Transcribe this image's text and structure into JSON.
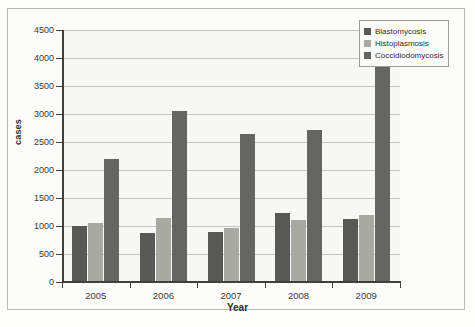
{
  "chart_data": {
    "type": "bar",
    "title": "",
    "xlabel": "Year",
    "ylabel": "cases",
    "categories": [
      "2005",
      "2006",
      "2007",
      "2008",
      "2009"
    ],
    "series": [
      {
        "name": "Blastomycosis",
        "color": "#585856",
        "values": [
          1000,
          870,
          900,
          1240,
          1130
        ]
      },
      {
        "name": "Histoplasmosis",
        "color": "#a9a9a4",
        "values": [
          1050,
          1150,
          970,
          1110,
          1200
        ]
      },
      {
        "name": "Coccidiodomycosis",
        "color": "#656563",
        "values": [
          2200,
          3060,
          2640,
          2710,
          4200
        ]
      }
    ],
    "ylim": [
      0,
      4500
    ],
    "ytick_step": 500,
    "yticks": [
      "0",
      "500",
      "1000",
      "1500",
      "2000",
      "2500",
      "3000",
      "3500",
      "4000",
      "4500"
    ],
    "grid": true,
    "legend_position": "top-right",
    "background": "#f7f7f5",
    "grid_color": "#9a9a95",
    "axis_color": "#3f3f3c"
  }
}
